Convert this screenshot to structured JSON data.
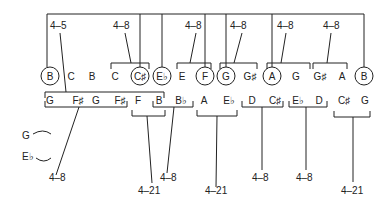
{
  "diagram": {
    "type": "set-class analysis",
    "top_row": [
      {
        "note": "B",
        "circled": true
      },
      {
        "note": "C",
        "circled": false
      },
      {
        "note": "B",
        "circled": false
      },
      {
        "note": "C",
        "circled": false
      },
      {
        "note": "C♯",
        "circled": true
      },
      {
        "note": "E♭",
        "circled": true
      },
      {
        "note": "E",
        "circled": false
      },
      {
        "note": "F",
        "circled": true
      },
      {
        "note": "G",
        "circled": true
      },
      {
        "note": "G♯",
        "circled": false
      },
      {
        "note": "A",
        "circled": true
      },
      {
        "note": "G",
        "circled": false
      },
      {
        "note": "G♯",
        "circled": false
      },
      {
        "note": "A",
        "circled": false
      },
      {
        "note": "B",
        "circled": true
      }
    ],
    "bottom_row": [
      "G",
      "F♯",
      "G",
      "F♯",
      "F",
      "B",
      "B♭",
      "A",
      "E♭",
      "D",
      "C♯",
      "E♭",
      "D",
      "C♯",
      "G"
    ],
    "top_labels": [
      "4–5",
      "4–8",
      "4–8",
      "4–8",
      "4–8",
      "4–8"
    ],
    "bottom_labels": [
      "4–8",
      "4–21",
      "4–8",
      "4–21",
      "4–8",
      "4–8",
      "4–21"
    ],
    "side_notes": [
      "G",
      "E♭"
    ]
  }
}
